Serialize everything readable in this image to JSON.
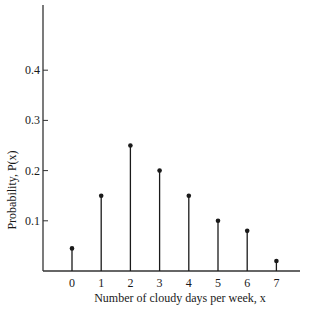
{
  "chart_data": {
    "type": "bar",
    "subtype": "stem",
    "title": "",
    "xlabel": "Number of cloudy days per week, x",
    "ylabel": "Probability, P(x)",
    "categories": [
      "0",
      "1",
      "2",
      "3",
      "4",
      "5",
      "6",
      "7"
    ],
    "x": [
      0,
      1,
      2,
      3,
      4,
      5,
      6,
      7
    ],
    "values": [
      0.045,
      0.15,
      0.25,
      0.2,
      0.15,
      0.1,
      0.08,
      0.02
    ],
    "yticks": [
      0.1,
      0.2,
      0.3,
      0.4
    ],
    "ytick_labels": [
      "0.1",
      "0.2",
      "0.3",
      "0.4"
    ],
    "ylim": [
      0,
      0.53
    ],
    "grid": false,
    "legend": null,
    "colors": {
      "stem": "#1a1a1a",
      "axis": "#333333"
    }
  }
}
